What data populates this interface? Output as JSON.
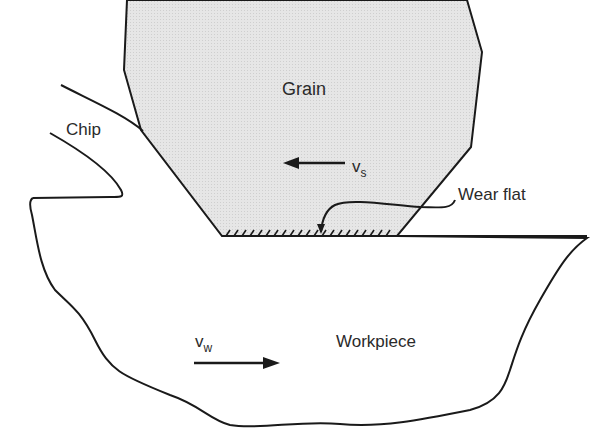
{
  "figure": {
    "labels": {
      "grain": "Grain",
      "chip": "Chip",
      "wear_flat": "Wear flat",
      "workpiece": "Workpiece",
      "vs_main": "v",
      "vs_sub": "s",
      "vw_main": "v",
      "vw_sub": "w"
    },
    "arrows": {
      "grain_velocity": "arrow-left",
      "workpiece_velocity": "arrow-right"
    },
    "colors": {
      "grain_fill": "#e4e4e4",
      "stroke": "#1a1a1a",
      "background": "#ffffff"
    }
  }
}
